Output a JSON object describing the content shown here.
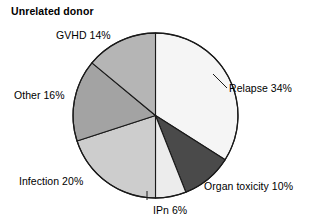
{
  "chart_data": {
    "type": "pie",
    "title": "Unrelated donor",
    "xlabel": "",
    "ylabel": "",
    "legend_position": "none",
    "grid": false,
    "start_angle_deg": 0,
    "direction": "clockwise",
    "categories": [
      "Relapse",
      "Organ toxicity",
      "IPn",
      "Infection",
      "Other",
      "GVHD"
    ],
    "values": [
      34,
      10,
      6,
      20,
      16,
      14
    ],
    "value_unit": "%",
    "slices": [
      {
        "name": "Relapse",
        "value": 34,
        "label": "Relapse 34%",
        "color": "#f5f5f5",
        "start_deg": 0,
        "end_deg": 122.4
      },
      {
        "name": "Organ toxicity",
        "value": 10,
        "label": "Organ toxicity 10%",
        "color": "#4a4a4a",
        "start_deg": 122.4,
        "end_deg": 158.4
      },
      {
        "name": "IPn",
        "value": 6,
        "label": "IPn 6%",
        "color": "#ececec",
        "start_deg": 158.4,
        "end_deg": 180
      },
      {
        "name": "Infection",
        "value": 20,
        "label": "Infection 20%",
        "color": "#cdcdcd",
        "start_deg": 180,
        "end_deg": 252
      },
      {
        "name": "Other",
        "value": 16,
        "label": "Other 16%",
        "color": "#a3a3a3",
        "start_deg": 252,
        "end_deg": 309.6
      },
      {
        "name": "GVHD",
        "value": 14,
        "label": "GVHD 14%",
        "color": "#b5b5b5",
        "start_deg": 309.6,
        "end_deg": 360
      }
    ],
    "outline_color": "#1a1a1a",
    "background_color": "#ffffff"
  }
}
